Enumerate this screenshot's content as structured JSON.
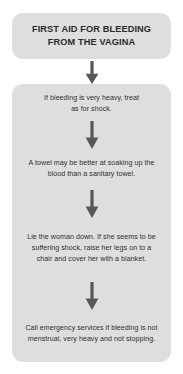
{
  "diagram": {
    "type": "flowchart",
    "orientation": "vertical",
    "colors": {
      "background": "#ffffff",
      "box_fill": "#dedede",
      "title_text": "#2b2b2b",
      "body_text": "#2f2f2f",
      "arrow": "#575757"
    },
    "title": {
      "text": "FIRST AID FOR BLEEDING\nFROM THE VAGINA",
      "line_1": "FIRST AID FOR BLEEDING",
      "line_2": "FROM THE VAGINA"
    },
    "steps": [
      {
        "index": 1,
        "text": "If bleeding is very heavy, treat\nas for shock."
      },
      {
        "index": 2,
        "text": "A towel may be better at soaking up the\nblood than a sanitary towel."
      },
      {
        "index": 3,
        "text": "Lie the woman down. If she seems to be\nsuffering shock, raise her legs on to a\nchair and cover her with a blanket."
      },
      {
        "index": 4,
        "text": "Call emergency services if bleeding is not\nmenstrual, very heavy and not stopping."
      }
    ],
    "connectors": [
      {
        "index": 1,
        "from": "title",
        "to": "step-1",
        "icon": "down-arrow-icon"
      },
      {
        "index": 2,
        "from": "step-1",
        "to": "step-2",
        "icon": "down-arrow-icon"
      },
      {
        "index": 3,
        "from": "step-2",
        "to": "step-3",
        "icon": "down-arrow-icon"
      },
      {
        "index": 4,
        "from": "step-3",
        "to": "step-4",
        "icon": "down-arrow-icon"
      }
    ]
  }
}
